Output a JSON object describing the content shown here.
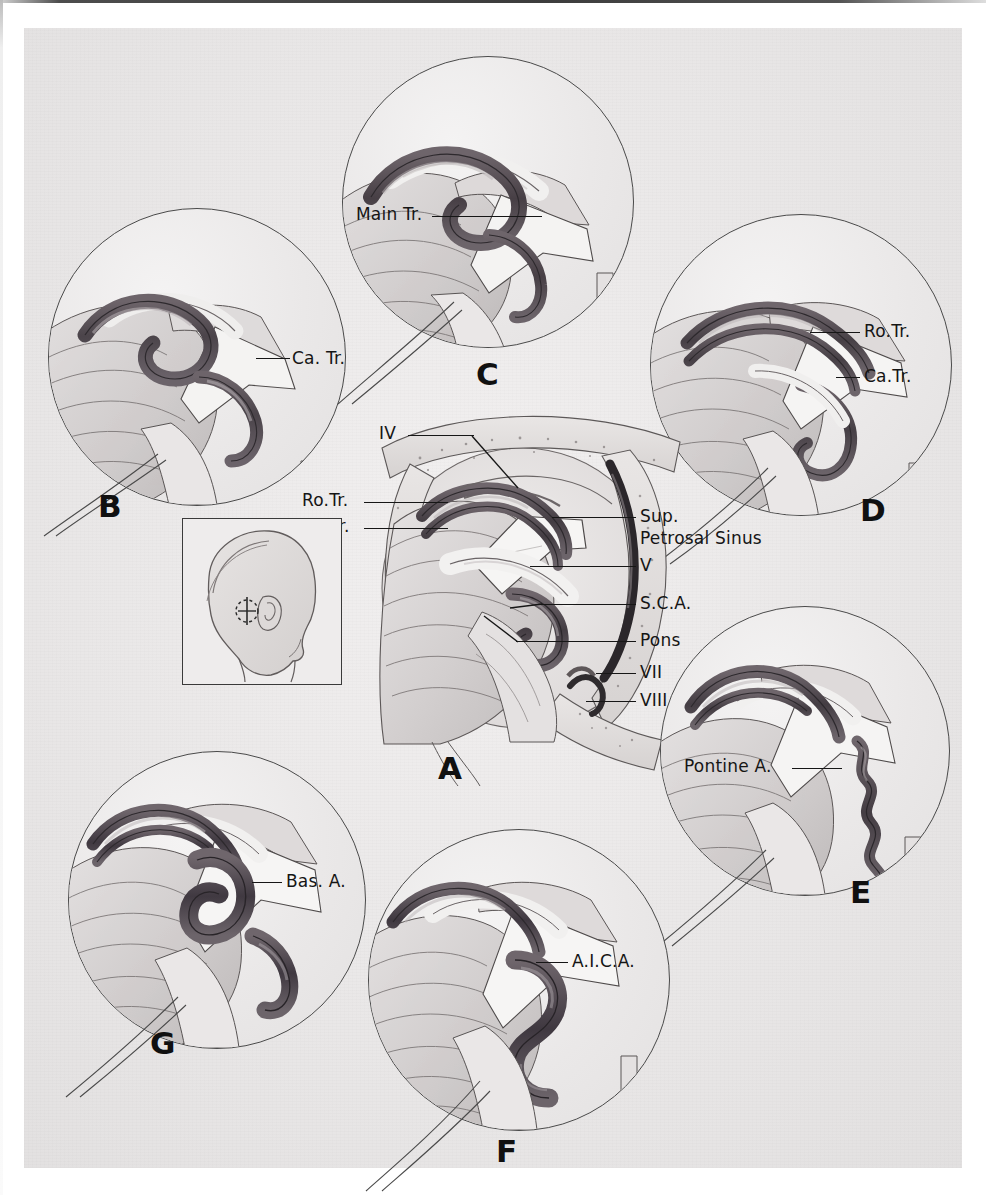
{
  "figure": {
    "kind": "neuroanatomical-illustration",
    "background_color": "#eceaea",
    "ink_color": "#151515",
    "vessel_color": "#5a5359"
  },
  "panels": [
    {
      "id": "A",
      "letter": "A",
      "role": "central-overview",
      "labels": [
        {
          "key": "iv",
          "text": "IV"
        },
        {
          "key": "ro_tr",
          "text": "Ro.Tr."
        },
        {
          "key": "ca_tr",
          "text": "Ca.Tr."
        },
        {
          "key": "sup_petrosal",
          "text": "Sup."
        },
        {
          "key": "sup_petrosal2",
          "text": "Petrosal Sinus"
        },
        {
          "key": "v",
          "text": "V"
        },
        {
          "key": "sca",
          "text": "S.C.A."
        },
        {
          "key": "pons",
          "text": "Pons"
        },
        {
          "key": "vii",
          "text": "VII"
        },
        {
          "key": "viii",
          "text": "VIII"
        }
      ]
    },
    {
      "id": "B",
      "letter": "B",
      "role": "magnified-inset",
      "labels": [
        {
          "key": "ca_tr",
          "text": "Ca. Tr."
        }
      ]
    },
    {
      "id": "C",
      "letter": "C",
      "role": "magnified-inset",
      "labels": [
        {
          "key": "main_tr",
          "text": "Main Tr."
        }
      ]
    },
    {
      "id": "D",
      "letter": "D",
      "role": "magnified-inset",
      "labels": [
        {
          "key": "ro_tr",
          "text": "Ro.Tr."
        },
        {
          "key": "ca_tr",
          "text": "Ca.Tr."
        }
      ]
    },
    {
      "id": "E",
      "letter": "E",
      "role": "magnified-inset",
      "labels": [
        {
          "key": "pontine_a",
          "text": "Pontine A."
        }
      ]
    },
    {
      "id": "F",
      "letter": "F",
      "role": "magnified-inset",
      "labels": [
        {
          "key": "aica",
          "text": "A.I.C.A."
        }
      ]
    },
    {
      "id": "G",
      "letter": "G",
      "role": "magnified-inset",
      "labels": [
        {
          "key": "bas_a",
          "text": "Bas. A."
        }
      ]
    }
  ],
  "head_inset": {
    "name": "orientation-head-diagram",
    "description": "Lateral view of head with retrosigmoid craniotomy site marked behind the ear"
  }
}
